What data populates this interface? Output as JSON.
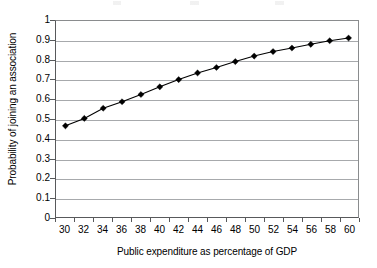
{
  "chart_data": {
    "type": "line",
    "title": "",
    "xlabel": "Public expenditure as percentage of GDP",
    "ylabel": "Probability of joining an association",
    "categories": [
      30,
      32,
      34,
      36,
      38,
      40,
      42,
      44,
      46,
      48,
      50,
      52,
      54,
      56,
      58,
      60
    ],
    "x_tick_labels": [
      "30",
      "32",
      "34",
      "36",
      "38",
      "40",
      "42",
      "44",
      "46",
      "48",
      "50",
      "52",
      "54",
      "56",
      "58",
      "60"
    ],
    "y_tick_labels": [
      "0",
      "0.1",
      "0.2",
      "0.3",
      "0.4",
      "0.5",
      "0.6",
      "0.7",
      "0.8",
      "0.9",
      "1"
    ],
    "y_tick_values": [
      0,
      0.1,
      0.2,
      0.3,
      0.4,
      0.5,
      0.6,
      0.7,
      0.8,
      0.9,
      1
    ],
    "values": [
      0.465,
      0.503,
      0.555,
      0.588,
      0.625,
      0.664,
      0.701,
      0.735,
      0.763,
      0.793,
      0.821,
      0.844,
      0.862,
      0.881,
      0.899,
      0.913
    ],
    "xlim": [
      29,
      61
    ],
    "ylim": [
      0,
      1
    ],
    "grid": true,
    "grid_axis": "y",
    "legend": false,
    "marker": "diamond",
    "series_color": "#000000",
    "grid_color": "#a7a9ac",
    "axis_color": "#58595b",
    "plot_background": "#ffffff"
  }
}
